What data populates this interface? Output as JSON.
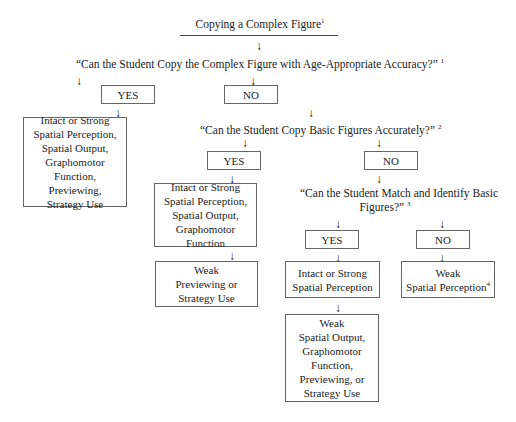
{
  "diagram": {
    "title": "Copying a Complex Figure",
    "title_sup": "1",
    "q1": {
      "text": "“Can the Student Copy the Complex Figure with Age-Appropriate Accuracy?”",
      "sup": "1"
    },
    "q1_yes": "YES",
    "q1_no": "NO",
    "result_a": [
      "Intact or Strong",
      "Spatial Perception,",
      "Spatial Output,",
      "Graphomotor Function,",
      "Previewing,",
      "Strategy Use"
    ],
    "q2": {
      "text": "“Can the Student Copy Basic Figures Accurately?”",
      "sup": "2"
    },
    "q2_yes": "YES",
    "q2_no": "NO",
    "result_b": [
      "Intact or Strong",
      "Spatial Perception,",
      "Spatial Output,",
      "Graphomotor Function"
    ],
    "result_c": [
      "Weak",
      "Previewing or",
      "Strategy Use"
    ],
    "q3": {
      "line1": "“Can the Student Match and Identify Basic",
      "line2": "Figures?”",
      "sup": "3"
    },
    "q3_yes": "YES",
    "q3_no": "NO",
    "result_d": [
      "Intact or Strong",
      "Spatial Perception"
    ],
    "result_e": {
      "line1": "Weak",
      "line2": "Spatial Perception",
      "sup": "4"
    },
    "result_f": [
      "Weak",
      "Spatial Output,",
      "Graphomotor",
      "Function,",
      "Previewing, or",
      "Strategy Use"
    ],
    "arrow_glyph": "↓"
  }
}
